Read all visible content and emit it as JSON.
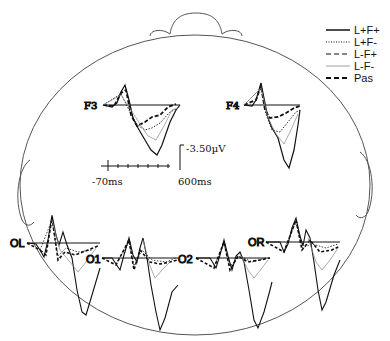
{
  "figure": {
    "type": "ERP topographic head map",
    "electrodes": [
      {
        "id": "F3",
        "label": "F3"
      },
      {
        "id": "F4",
        "label": "F4"
      },
      {
        "id": "OL",
        "label": "OL"
      },
      {
        "id": "O1",
        "label": "O1"
      },
      {
        "id": "O2",
        "label": "O2"
      },
      {
        "id": "OR",
        "label": "OR"
      }
    ],
    "calibration": {
      "amplitude_label": "-3.50µV",
      "time_start_label": "-70ms",
      "time_end_label": "600ms"
    },
    "legend": [
      {
        "label": "L+F+",
        "style": "solid"
      },
      {
        "label": "L+F-",
        "style": "dotted"
      },
      {
        "label": "L-F+",
        "style": "dashed"
      },
      {
        "label": "L-F-",
        "style": "thin-gray"
      },
      {
        "label": "Pas",
        "style": "thick-dashed"
      }
    ],
    "colors": {
      "line": "#111111",
      "head": "#555555",
      "light": "#999999"
    }
  }
}
